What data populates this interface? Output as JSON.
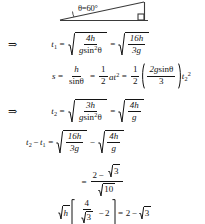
{
  "document": {
    "kind": "handwritten-style physics derivation",
    "background_color": "#ffffff",
    "ink_color": "#141414"
  },
  "diagram": {
    "name": "inclined-plane-triangle",
    "angle_label": "θ=60°",
    "right_angle_marker": true
  },
  "symbols": {
    "implies": "⇒",
    "equals": "=",
    "minus": "−",
    "theta": "θ",
    "sqrt_sign": "√"
  },
  "lines": [
    {
      "id": "line-t1",
      "implies": "⇒",
      "lhs_var": "t",
      "lhs_sub": "1",
      "eq1": "=",
      "rad1": {
        "num": "4h",
        "den_g": "g",
        "den_sin": "sin",
        "den_sup": "2",
        "den_theta": "θ"
      },
      "eq2": "=",
      "rad2": {
        "num": "16h",
        "den": "3g"
      }
    },
    {
      "id": "line-s",
      "lhs_var": "s",
      "eq1": "=",
      "frac1": {
        "num": "h",
        "den_sin": "sin",
        "den_theta": "θ"
      },
      "eq2": "=",
      "frac2": {
        "num": "1",
        "den": "2"
      },
      "at2_a": "a",
      "at2_t": "t",
      "at2_sup": "2",
      "eq3": "=",
      "frac3": {
        "num": "1",
        "den": "2"
      },
      "paren": {
        "num_2g": "2g",
        "num_sin": "sin",
        "num_theta": "θ",
        "den": "3"
      },
      "tail_t": "t",
      "tail_sub": "2",
      "tail_sup": "2"
    },
    {
      "id": "line-t2",
      "implies": "⇒",
      "lhs_var": "t",
      "lhs_sub": "2",
      "eq1": "=",
      "rad1": {
        "num": "3h",
        "den_g": "g",
        "den_sin": "sin",
        "den_sup": "2",
        "den_theta": "θ"
      },
      "eq2": "=",
      "rad2": {
        "num": "4h",
        "den": "g"
      }
    },
    {
      "id": "line-diff",
      "lhs_t2": "t",
      "lhs_t2_sub": "2",
      "minus": "−",
      "lhs_t1": "t",
      "lhs_t1_sub": "1",
      "eq1": "=",
      "rad1": {
        "num": "16h",
        "den": "3g"
      },
      "op": "−",
      "rad2": {
        "num": "4h",
        "den": "g"
      }
    },
    {
      "id": "line-result",
      "eq1": "=",
      "frac": {
        "num_2": "2",
        "num_minus": "−",
        "num_sqrt3": "3",
        "den_sqrt10": "10"
      }
    },
    {
      "id": "line-final",
      "sqrt_h": "h",
      "frac": {
        "num": "4",
        "den_sqrt": "3"
      },
      "minus": "−",
      "two": "2",
      "eq": "=",
      "rhs_2": "2",
      "rhs_minus": "−",
      "rhs_sqrt3": "3"
    }
  ]
}
